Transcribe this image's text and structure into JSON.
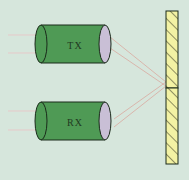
{
  "diagram": {
    "type": "optical-sensor-reflector",
    "background_color": "#d6e6dc",
    "transmitter": {
      "label": "TX",
      "body_color": "#4f9a55",
      "lens_color": "#c9bfd6"
    },
    "receiver": {
      "label": "RX",
      "body_color": "#4f9a55",
      "lens_color": "#c9bfd6"
    },
    "reflector": {
      "fill_color": "#f3f2a4",
      "hatch_color": "#2a2a1a",
      "segments": 2
    },
    "beam_color": "#d9a9a0",
    "lead_wire_color": "#e6c9c9"
  }
}
